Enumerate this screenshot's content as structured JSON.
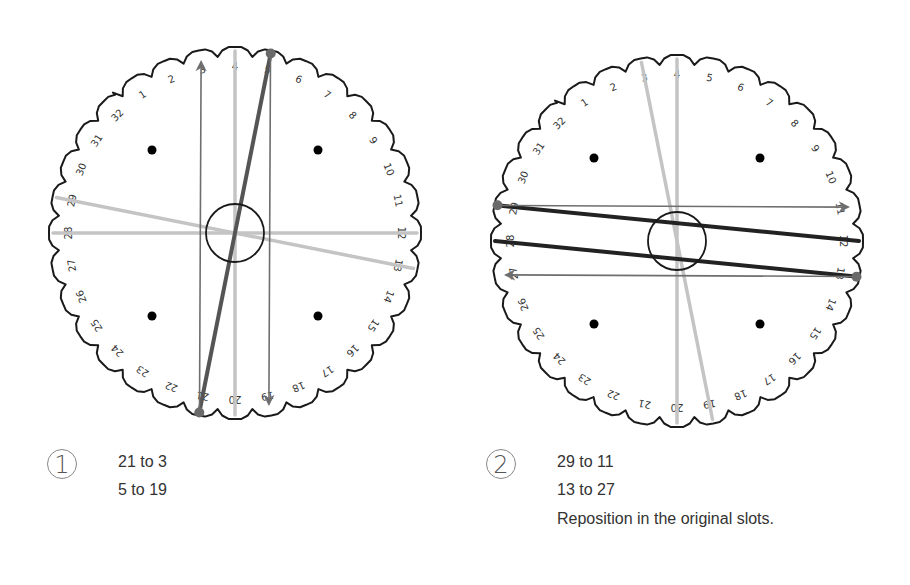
{
  "diagrams": [
    {
      "id": "disk-1",
      "center": [
        235,
        233
      ],
      "radius": 186,
      "step_number": "1",
      "instructions": [
        "21 to 3",
        "5 to 19"
      ],
      "active_endpoints": [
        21,
        5
      ],
      "strings": [
        {
          "from": 21,
          "to": 3,
          "style": "arrow"
        },
        {
          "from": 5,
          "to": 19,
          "style": "arrow"
        },
        {
          "from": 21,
          "to": 5,
          "style": "thick-dark"
        },
        {
          "from": 4,
          "to": 20,
          "style": "light"
        },
        {
          "from": 29,
          "to": 13,
          "style": "light"
        },
        {
          "from": 28,
          "to": 12,
          "style": "light"
        }
      ]
    },
    {
      "id": "disk-2",
      "center": [
        677,
        241
      ],
      "radius": 186,
      "step_number": "2",
      "instructions": [
        "29 to 11",
        "13 to 27",
        "Reposition in the original slots."
      ],
      "active_endpoints": [
        29,
        13
      ],
      "strings": [
        {
          "from": 29,
          "to": 11,
          "style": "arrow"
        },
        {
          "from": 13,
          "to": 27,
          "style": "arrow"
        },
        {
          "from": 29,
          "to": 12,
          "style": "thick-black"
        },
        {
          "from": 28,
          "to": 13,
          "style": "thick-black"
        },
        {
          "from": 4,
          "to": 20,
          "style": "light"
        },
        {
          "from": 3,
          "to": 19,
          "style": "light"
        }
      ]
    }
  ],
  "slot_labels": [
    "1",
    "2",
    "3",
    "4",
    "5",
    "6",
    "7",
    "8",
    "9",
    "10",
    "11",
    "12",
    "13",
    "14",
    "15",
    "16",
    "17",
    "18",
    "19",
    "20",
    "21",
    "22",
    "23",
    "24",
    "25",
    "26",
    "27",
    "28",
    "29",
    "30",
    "31",
    "32"
  ],
  "colors": {
    "outline": "#1a1a1a",
    "arrow": "#6e6e6e",
    "thick_dark": "#555555",
    "thick_black": "#222222",
    "light": "#c4c4c4",
    "dot": "#000000",
    "endpoint": "#6a6a6a",
    "text": "#333333"
  }
}
